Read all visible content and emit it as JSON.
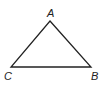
{
  "diagram": {
    "type": "triangle",
    "stroke_color": "#222222",
    "vertices": [
      {
        "name": "A",
        "x": 50,
        "y": 21,
        "label_x": 47,
        "label_y": 17
      },
      {
        "name": "B",
        "x": 91,
        "y": 67,
        "label_x": 91,
        "label_y": 80
      },
      {
        "name": "C",
        "x": 11,
        "y": 67,
        "label_x": 4,
        "label_y": 80
      }
    ],
    "labels": {
      "A": "A",
      "B": "B",
      "C": "C"
    }
  }
}
